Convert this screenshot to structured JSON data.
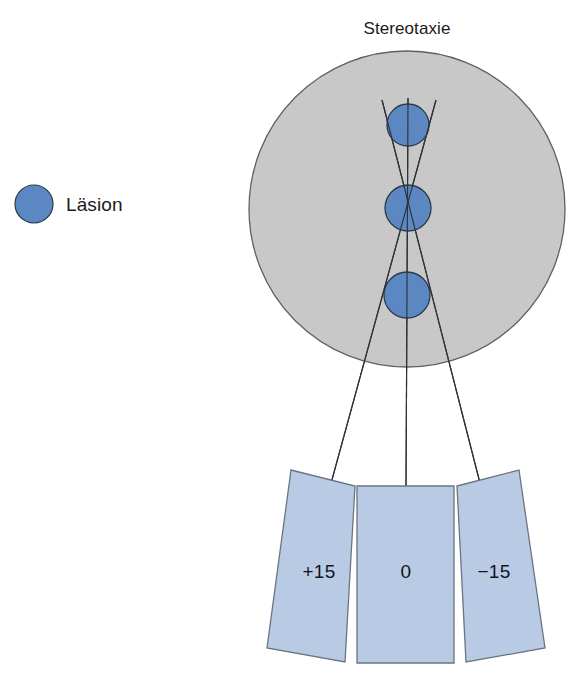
{
  "figure": {
    "title": "Stereotaxie",
    "title_x": 407,
    "title_y": 34
  },
  "legend": {
    "label": "Läsion",
    "marker_icon": "lesion-circle-icon",
    "marker": {
      "cx": 34,
      "cy": 204,
      "r": 19
    },
    "label_x": 66,
    "label_y": 211
  },
  "colors": {
    "lesion_fill": "#5b87c2",
    "lesion_stroke": "#2f3a47",
    "head_fill": "#c8c8c8",
    "head_stroke": "#5d6166",
    "panel_fill": "#b9cbe4",
    "panel_stroke": "#6b7480",
    "trajectory_stroke": "#2e3338",
    "text": "#1a1a1a",
    "background": "#ffffff"
  },
  "head": {
    "name": "head-cross-section",
    "cx": 407,
    "cy": 209,
    "r": 158
  },
  "lesions": [
    {
      "name": "lesion-superior",
      "cx": 408,
      "cy": 125,
      "r": 21
    },
    {
      "name": "lesion-target",
      "cx": 408,
      "cy": 208,
      "r": 23
    },
    {
      "name": "lesion-inferior",
      "cx": 407,
      "cy": 295,
      "r": 23
    }
  ],
  "target_point": {
    "x": 408,
    "y": 208
  },
  "trajectories": [
    {
      "name": "trajectory-plus-15",
      "angle_label": "+15",
      "x1": 436,
      "y1": 100,
      "x2": 330,
      "y2": 487
    },
    {
      "name": "trajectory-zero",
      "angle_label": "0",
      "x1": 408,
      "y1": 98,
      "x2": 406,
      "y2": 487
    },
    {
      "name": "trajectory-minus-15",
      "angle_label": "-15",
      "x1": 382,
      "y1": 100,
      "x2": 481,
      "y2": 487
    }
  ],
  "panels": [
    {
      "name": "panel-plus-15",
      "label": "+15",
      "points": "291,470 355,486 345,662 267,648",
      "label_x": 319,
      "label_y": 578
    },
    {
      "name": "panel-zero",
      "label": "0",
      "points": "357,486 454,486 454,663 357,663",
      "label_x": 406,
      "label_y": 578
    },
    {
      "name": "panel-minus-15",
      "label": "-15",
      "points": "457,486 519,470 545,648 466,662",
      "label_x": 494,
      "label_y": 578
    }
  ]
}
